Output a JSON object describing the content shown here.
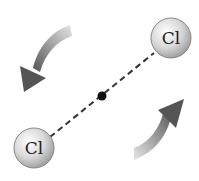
{
  "diagram": {
    "atoms": [
      {
        "label": "Cl",
        "position": "upper-right"
      },
      {
        "label": "Cl",
        "position": "lower-left"
      }
    ],
    "bond_style": "dashed",
    "center_marker": "center-of-mass dot",
    "rotation_arrows": [
      "counterclockwise arrow upper-left",
      "counterclockwise arrow lower-right"
    ],
    "colors": {
      "atom_fill": "#d8d8d8",
      "arrow": "#6a6a6a",
      "bond": "#333333"
    }
  }
}
